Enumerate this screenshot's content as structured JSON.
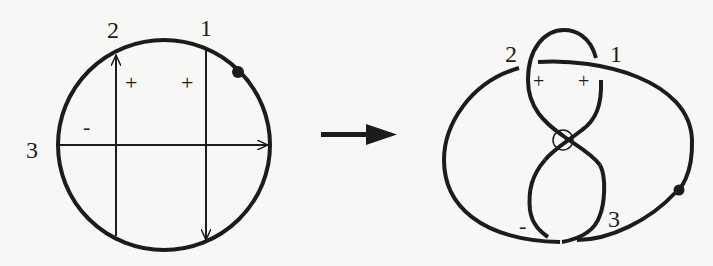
{
  "figure": {
    "colors": {
      "stroke": "#1c1c1c",
      "background": "#f7f7f5"
    }
  },
  "left_panel": {
    "title": "chord-diagram",
    "chord_labels": [
      "1",
      "2",
      "3"
    ],
    "signs": [
      "+",
      "+",
      "-"
    ],
    "base_point": "filled dot on circle"
  },
  "arrow": {
    "direction": "right"
  },
  "right_panel": {
    "title": "knot-diagram",
    "crossing_labels": [
      "2",
      "1",
      "3"
    ],
    "signs": [
      "+",
      "+",
      "-"
    ],
    "virtual_crossing": "small circle at center",
    "base_point": "filled dot on curve"
  }
}
